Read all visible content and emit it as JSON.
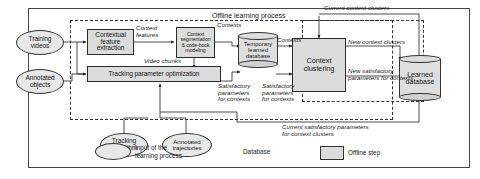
{
  "figure": {
    "title_top": "Offline learning process",
    "title_top_right": "Current context clusters"
  },
  "inputs": [
    {
      "id": "training-videos",
      "label": "Training\nvideos"
    },
    {
      "id": "annotated-objects",
      "label": "Annotated\nobjects"
    },
    {
      "id": "tracking-algorithm",
      "label": "Tracking\nalgorithm"
    },
    {
      "id": "annotated-trajectories",
      "label": "Annotated\ntrajectories"
    }
  ],
  "processes": [
    {
      "id": "contextual-feature-extraction",
      "label": "Contextual\nfeature\nextraction"
    },
    {
      "id": "context-segmentation-codebook",
      "label": "Context\nsegmentation\n& code-book\nmodeling"
    },
    {
      "id": "tracking-parameter-optimization",
      "label": "Tracking parameter optimization"
    },
    {
      "id": "context-clustering",
      "label": "Context\nclustering"
    }
  ],
  "databases": [
    {
      "id": "temporary-learned-database",
      "label": "Temporary\nlearned\ndatabase"
    },
    {
      "id": "learned-database",
      "label": "Learned\ndatabase"
    }
  ],
  "edge_labels": [
    {
      "id": "context-features",
      "text": "Context\nfeatures"
    },
    {
      "id": "video-chunks",
      "text": "Video chunks"
    },
    {
      "id": "contexts-left",
      "text": "Contexts"
    },
    {
      "id": "contexts-right",
      "text": "Contexts"
    },
    {
      "id": "satisfactory-parameters-left",
      "text": "Satisfactory\nparameters\nfor contexts"
    },
    {
      "id": "satisfactory-parameters-right",
      "text": "Satisfactory\nparameters\nfor contexts"
    },
    {
      "id": "new-context-clusters",
      "text": "New context clusters"
    },
    {
      "id": "new-satisfactory-parameters",
      "text": "New satisfactory\nparameters for contexts"
    },
    {
      "id": "current-satisfactory-parameters",
      "text": "Current satisfactory parameters\nfor context clusters"
    }
  ],
  "legend": {
    "items": [
      {
        "id": "legend-input",
        "shape": "ellipse",
        "label": "Input of the\nlearning process"
      },
      {
        "id": "legend-database",
        "shape": "cylinder",
        "label": "Database"
      },
      {
        "id": "legend-offline-step",
        "shape": "box",
        "label": "Offline step"
      }
    ]
  },
  "colors": {
    "stroke": "#333333",
    "process_fill": "#dcdcdc",
    "input_fill": "#e8e8e8",
    "database_fill": "#dedede",
    "background": "#ffffff"
  }
}
